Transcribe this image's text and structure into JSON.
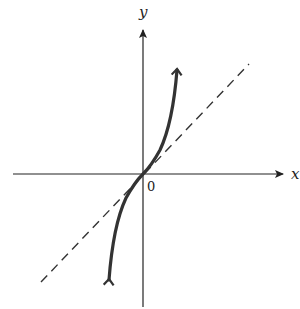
{
  "figure": {
    "x_axis_label": "x",
    "y_axis_label": "y",
    "origin_label": "0",
    "curve": "increasing cubic-like curve through origin, tangent to dashed line at origin",
    "dashed_line": "line y = x through origin"
  },
  "colors": {
    "axes": "#222222",
    "curve": "#333333",
    "dashed": "#333333",
    "background": "#ffffff"
  }
}
